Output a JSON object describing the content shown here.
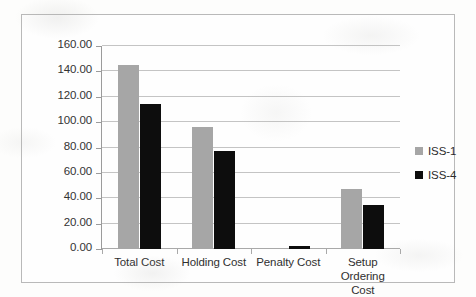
{
  "chart_data": {
    "type": "bar",
    "title": "",
    "subtitle": "",
    "xlabel": "",
    "ylabel": "",
    "categories": [
      "Total Cost",
      "Holding Cost",
      "Penalty Cost",
      "Setup Ordering Cost"
    ],
    "category_lines": [
      [
        "Total Cost"
      ],
      [
        "Holding Cost"
      ],
      [
        "Penalty Cost"
      ],
      [
        "Setup Ordering",
        "Cost"
      ]
    ],
    "series": [
      {
        "name": "ISS-1",
        "color": "#a6a6a6",
        "values": [
          145.0,
          96.5,
          0.0,
          47.0
        ]
      },
      {
        "name": "ISS-4",
        "color": "#0d0d0d",
        "values": [
          114.5,
          77.5,
          2.5,
          35.0
        ]
      }
    ],
    "ylim": [
      0,
      160
    ],
    "ytick_step": 20,
    "ytick_labels": [
      "0.00",
      "20.00",
      "40.00",
      "60.00",
      "80.00",
      "100.00",
      "120.00",
      "140.00",
      "160.00"
    ],
    "ytick_values": [
      0,
      20,
      40,
      60,
      80,
      100,
      120,
      140,
      160
    ],
    "grid": true,
    "grid_axis": "y",
    "legend_position": "right",
    "legend": [
      {
        "label": "ISS-1",
        "color": "#a6a6a6"
      },
      {
        "label": "ISS-4",
        "color": "#0d0d0d"
      }
    ]
  },
  "frame": {
    "border_color": "#b9b9b9",
    "background": "#fefefe"
  }
}
